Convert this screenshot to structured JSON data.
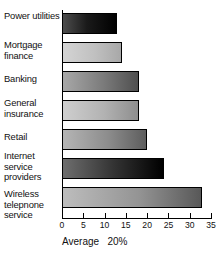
{
  "chart_data": {
    "type": "bar",
    "orientation": "horizontal",
    "title": "",
    "subtitle": "",
    "xlabel": "Average   20%",
    "ylabel": "",
    "xlim": [
      0,
      35
    ],
    "grid": false,
    "legend": null,
    "categories": [
      "Power utilities",
      "Mortgage finance",
      "Banking",
      "General insurance",
      "Retail",
      "Internet service providers",
      "Wireless telepnone service"
    ],
    "values": [
      13,
      14,
      18,
      18,
      20,
      24,
      33
    ],
    "xticks": [
      0,
      5,
      10,
      15,
      20,
      25,
      30,
      35
    ],
    "xtick_labels": [
      "0",
      "5",
      "10",
      "15",
      "20",
      "25",
      "30",
      "35"
    ],
    "annotations": [
      "Average   20%"
    ]
  },
  "category_labels": [
    {
      "lines": "Power\nutilities"
    },
    {
      "lines": "Mortgage\nfinance"
    },
    {
      "lines": "Banking"
    },
    {
      "lines": "General\ninsurance"
    },
    {
      "lines": "Retail"
    },
    {
      "lines": "Internet\nservice\nproviders"
    },
    {
      "lines": "Wireless\ntelepnone\nservice"
    }
  ],
  "caption": {
    "label": "Average",
    "value": "20%",
    "full": "Average   20%"
  },
  "colors": {
    "axis": "#000000",
    "text": "#111111",
    "background": "#ffffff",
    "bar_dark": "#000000",
    "bar_light": "#c0c0c0",
    "bar_mid": "#7a7a7a"
  }
}
